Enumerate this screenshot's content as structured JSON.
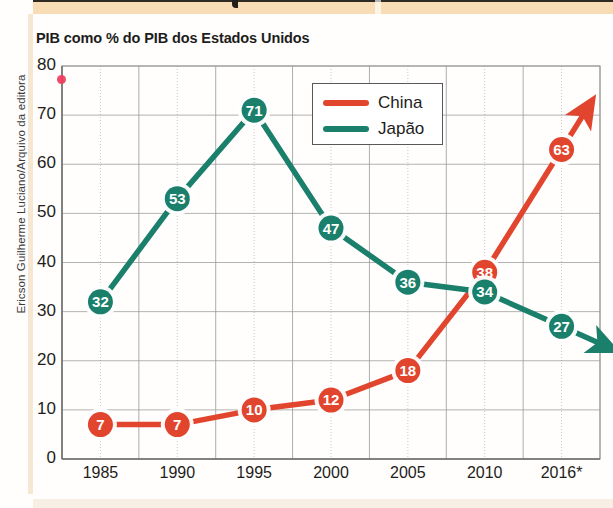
{
  "credit": "Ericson Guilherme Luciano/Arquivo da editora",
  "chart_data": {
    "type": "line",
    "title": "PIB como % do PIB dos Estados Unidos",
    "xlabel": "",
    "ylabel": "",
    "categories": [
      "1985",
      "1990",
      "1995",
      "2000",
      "2005",
      "2010",
      "2016*"
    ],
    "x": [
      1985,
      1990,
      1995,
      2000,
      2005,
      2010,
      2016
    ],
    "ylim": [
      0,
      80
    ],
    "yticks": [
      "0",
      "10",
      "20",
      "30",
      "40",
      "50",
      "60",
      "70",
      "80"
    ],
    "grid": true,
    "legend_position": "top-center",
    "series": [
      {
        "name": "China",
        "color": "#e2452e",
        "values": [
          7,
          7,
          10,
          12,
          18,
          38,
          63
        ],
        "labels": [
          "7",
          "7",
          "10",
          "12",
          "18",
          "38",
          "63"
        ],
        "trend_arrow": "up-right"
      },
      {
        "name": "Japão",
        "color": "#1a7f6b",
        "values": [
          32,
          53,
          71,
          47,
          36,
          34,
          27
        ],
        "labels": [
          "32",
          "53",
          "71",
          "47",
          "36",
          "34",
          "27"
        ],
        "trend_arrow": "down-right"
      }
    ],
    "annotations": [
      "* valor estimado para 2016"
    ]
  },
  "legend": {
    "items": [
      {
        "label": "China",
        "color": "#e2452e"
      },
      {
        "label": "Japão",
        "color": "#1a7f6b"
      }
    ]
  },
  "colors": {
    "china": "#e2452e",
    "japao": "#1a7f6b",
    "grid": "#9a9a9a",
    "band": "#f7dcb6",
    "text": "#1d1d1b"
  }
}
